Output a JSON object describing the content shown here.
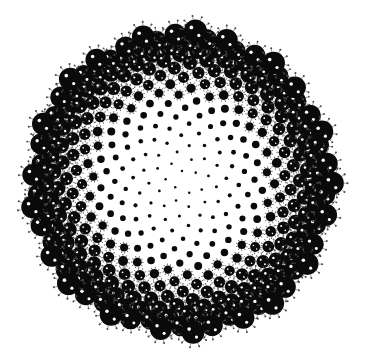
{
  "image": {
    "description": "Phyllotaxis (sunflower spiral) arrangement of black virus-like spheres with spike proteins, shrinking toward a white center",
    "background": "#ffffff",
    "foreground": "#0a0a0a",
    "highlight": "#ffffff",
    "center": [
      181,
      182
    ],
    "outer_radius": 152,
    "count": 380,
    "max_dot_radius": 11.5,
    "min_dot_radius": 1.2,
    "spikes_per_dot": 10
  }
}
